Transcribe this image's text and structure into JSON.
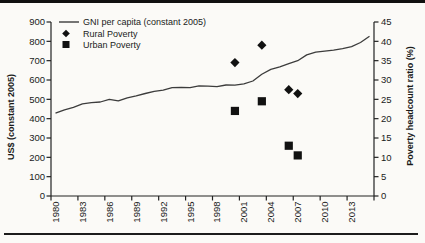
{
  "colors": {
    "background": "#fbfaf7",
    "ink": "#1a1a1a",
    "axis": "#222222",
    "gni_line": "#3c3c3c",
    "marker": "#111111",
    "rule": "#101010"
  },
  "chart_data": {
    "type": "line",
    "title": "",
    "grid": false,
    "legend": {
      "position": "top-left-inside",
      "entries": [
        {
          "label": "GNI per capita (constant 2005)",
          "swatch": "line"
        },
        {
          "label": "Rural Poverty",
          "swatch": "diamond"
        },
        {
          "label": "Urban Poverty",
          "swatch": "square"
        }
      ]
    },
    "x_axis": {
      "label": "",
      "tick_labels": [
        "1980",
        "1983",
        "1986",
        "1989",
        "1992",
        "1995",
        "1998",
        "2001",
        "2004",
        "2007",
        "2010",
        "2013"
      ],
      "tick_interval_years": 3,
      "year_range": [
        1979.5,
        2015.5
      ]
    },
    "left_axis": {
      "label": "US$ (constant 2005)",
      "range": [
        0,
        900
      ],
      "tick_step": 100,
      "tick_labels": [
        "0",
        "100",
        "200",
        "300",
        "400",
        "500",
        "600",
        "700",
        "800",
        "900"
      ]
    },
    "right_axis": {
      "label": "Poverty headcount ratio (%)",
      "range": [
        0,
        45
      ],
      "tick_step": 5,
      "tick_labels": [
        "0",
        "5",
        "10",
        "15",
        "20",
        "25",
        "30",
        "35",
        "40",
        "45"
      ]
    },
    "series": [
      {
        "name": "GNI per capita (constant 2005)",
        "type": "line",
        "axis": "left",
        "marker": "none",
        "x_start_year": 1980,
        "x_step": 1,
        "values": [
          429,
          446,
          459,
          477,
          483,
          486,
          500,
          492,
          508,
          518,
          530,
          541,
          547,
          560,
          562,
          560,
          570,
          568,
          566,
          574,
          573,
          580,
          595,
          630,
          655,
          668,
          685,
          700,
          730,
          744,
          749,
          754,
          762,
          772,
          794,
          826
        ]
      },
      {
        "name": "Rural Poverty",
        "type": "scatter",
        "axis": "right",
        "marker": "diamond",
        "points": [
          {
            "year": 2000,
            "value": 34.5
          },
          {
            "year": 2003,
            "value": 39.0
          },
          {
            "year": 2006,
            "value": 27.5
          },
          {
            "year": 2007,
            "value": 26.5
          }
        ]
      },
      {
        "name": "Urban Poverty",
        "type": "scatter",
        "axis": "right",
        "marker": "square",
        "points": [
          {
            "year": 2000,
            "value": 22.0
          },
          {
            "year": 2003,
            "value": 24.5
          },
          {
            "year": 2006,
            "value": 13.0
          },
          {
            "year": 2007,
            "value": 10.5
          }
        ]
      }
    ]
  }
}
